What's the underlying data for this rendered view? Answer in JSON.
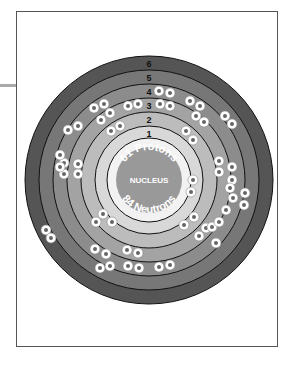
{
  "diagram": {
    "nucleus": {
      "label": "NUCLEUS",
      "protons_label": "61 Protons",
      "neutrons_label": "84 Neutrons"
    },
    "shells": [
      {
        "number": "1",
        "electrons": 2
      },
      {
        "number": "2",
        "electrons": 8
      },
      {
        "number": "3",
        "electrons": 18
      },
      {
        "number": "4",
        "electrons": 23
      },
      {
        "number": "5",
        "electrons": 8
      },
      {
        "number": "6",
        "electrons": 2
      }
    ],
    "electron_symbol": "e",
    "colors": {
      "shell6": "#555555",
      "shell5": "#777777",
      "shell4": "#8c8c8c",
      "shell3": "#a3a3a3",
      "shell2": "#bcbcbc",
      "shell1": "#d8d8d8",
      "white_ring": "#f2f2f2",
      "nucleus": "#999999"
    }
  }
}
